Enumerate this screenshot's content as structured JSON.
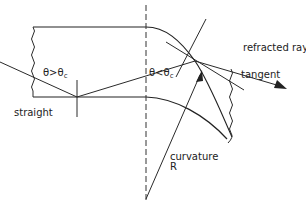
{
  "diagram": {
    "labels": {
      "theta_gt": "θ>θ",
      "theta_gt_sub": "c",
      "theta_lt": "θ<θ",
      "theta_lt_sub": "c",
      "straight": "straight",
      "refracted_ray": "refracted ray",
      "tangent": "tangent",
      "curvature": "curvature",
      "radius": "R"
    },
    "colors": {
      "line": "#2a2a2a",
      "background": "#ffffff"
    }
  }
}
